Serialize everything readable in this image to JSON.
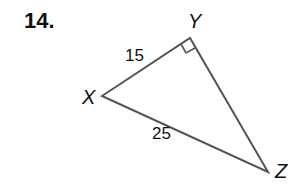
{
  "problem": {
    "number": "14."
  },
  "triangle": {
    "vertices": {
      "X": {
        "label": "X",
        "x": 102,
        "y": 96
      },
      "Y": {
        "label": "Y",
        "x": 190,
        "y": 38
      },
      "Z": {
        "label": "Z",
        "x": 268,
        "y": 172
      }
    },
    "sides": {
      "XY": {
        "label": "15"
      },
      "XZ": {
        "label": "25"
      },
      "YZ": {
        "label": ""
      }
    },
    "right_angle_at": "Y",
    "line_color": "#555555"
  }
}
